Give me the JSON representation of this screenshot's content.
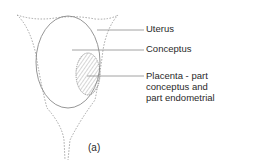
{
  "figure": {
    "panel_label": "(a)",
    "labels": [
      {
        "id": "uterus",
        "text": "Uterus"
      },
      {
        "id": "conceptus",
        "text": "Conceptus"
      },
      {
        "id": "placenta",
        "lines": [
          "Placenta - part",
          "conceptus and",
          "part endometrial"
        ]
      }
    ],
    "colors": {
      "line": "#8a8a8a",
      "dashed": "#9a9a9a",
      "text": "#2a2a2a"
    }
  }
}
